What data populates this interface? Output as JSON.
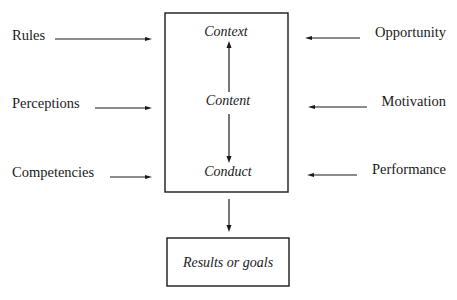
{
  "diagram": {
    "central_box": {
      "items": [
        "Context",
        "Content",
        "Conduct"
      ],
      "internal_arrows": [
        {
          "from": "Content",
          "to": "Context"
        },
        {
          "from": "Content",
          "to": "Conduct"
        }
      ]
    },
    "output_box": {
      "label": "Results or goals"
    },
    "left_inputs": [
      {
        "label": "Rules",
        "points_to": "Context"
      },
      {
        "label": "Perceptions",
        "points_to": "Content"
      },
      {
        "label": "Competencies",
        "points_to": "Conduct"
      }
    ],
    "right_inputs": [
      {
        "label": "Opportunity",
        "points_to": "Context"
      },
      {
        "label": "Motivation",
        "points_to": "Content"
      },
      {
        "label": "Performance",
        "points_to": "Conduct"
      }
    ],
    "flow": {
      "from": "central_box",
      "to": "output_box"
    },
    "colors": {
      "ink": "#1a1a1a",
      "background": "#ffffff"
    }
  }
}
